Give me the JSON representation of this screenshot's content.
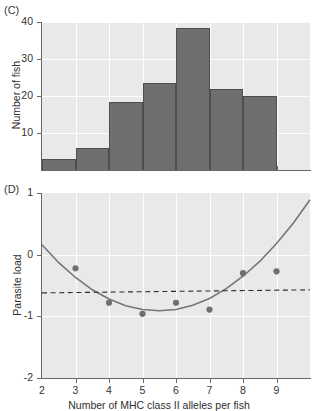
{
  "figure": {
    "panels": [
      {
        "letter": "(C)"
      },
      {
        "letter": "(D)"
      }
    ]
  },
  "chart_data": [
    {
      "panel": "C",
      "type": "bar",
      "title": "",
      "xlabel": "",
      "ylabel": "Number of fish",
      "categories": [
        "2",
        "3",
        "4",
        "5",
        "6",
        "7",
        "8",
        "9"
      ],
      "bin_edges": [
        2,
        3,
        4,
        5,
        6,
        7,
        8,
        9
      ],
      "values": [
        3,
        6,
        18.5,
        23.5,
        38.5,
        22,
        20
      ],
      "ylim": [
        0,
        40
      ],
      "yticks": [
        10,
        20,
        30,
        40
      ],
      "yticklabels": [
        "10",
        "20",
        "30",
        "40"
      ],
      "xlim": [
        2,
        10
      ],
      "grid": true,
      "legend": "none",
      "bar_color": "#6f6f6f",
      "background": "#e9e9e9"
    },
    {
      "panel": "D",
      "type": "scatter",
      "title": "",
      "xlabel": "Number of MHC class II alleles per fish",
      "ylabel": "Parasite load",
      "x": [
        3,
        4,
        5,
        6,
        7,
        8,
        9
      ],
      "y": [
        -0.22,
        -0.78,
        -0.96,
        -0.78,
        -0.89,
        -0.3,
        -0.27
      ],
      "xlim": [
        2,
        10
      ],
      "ylim": [
        -2,
        1
      ],
      "xticks": [
        2,
        3,
        4,
        5,
        6,
        7,
        8,
        9
      ],
      "xticklabels": [
        "2",
        "3",
        "4",
        "5",
        "6",
        "7",
        "8",
        "9"
      ],
      "yticks": [
        1,
        0,
        -1,
        -2
      ],
      "yticklabels": [
        "1",
        "0",
        "-1",
        "-2"
      ],
      "grid": true,
      "legend": "none",
      "point_color": "#6f6f6f",
      "background": "#e9e9e9",
      "series": [
        {
          "name": "quadratic fit",
          "kind": "line",
          "points_x": [
            2.0,
            2.5,
            3.0,
            3.5,
            4.0,
            4.5,
            5.0,
            5.5,
            6.0,
            6.5,
            7.0,
            7.5,
            8.0,
            8.5,
            9.0,
            9.5,
            10.0
          ],
          "points_y": [
            0.16,
            -0.13,
            -0.37,
            -0.57,
            -0.72,
            -0.83,
            -0.89,
            -0.91,
            -0.89,
            -0.82,
            -0.71,
            -0.55,
            -0.35,
            -0.11,
            0.18,
            0.51,
            0.89
          ]
        },
        {
          "name": "reference line",
          "kind": "dashed-horizontal",
          "y_left": -0.62,
          "y_right": -0.57
        }
      ]
    }
  ]
}
